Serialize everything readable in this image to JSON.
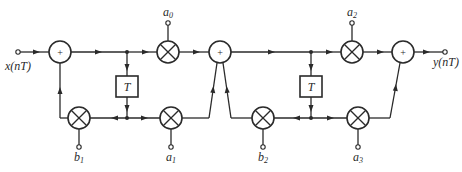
{
  "diagram": {
    "type": "signal-flow block diagram",
    "input_label": "x(nT)",
    "output_label": "y(nT)",
    "adder_symbol": "+",
    "delay_label": "T",
    "coefficients": {
      "a0": {
        "base": "a",
        "sub": "0"
      },
      "a1": {
        "base": "a",
        "sub": "1"
      },
      "a2": {
        "base": "a",
        "sub": "2"
      },
      "a3": {
        "base": "a",
        "sub": "3"
      },
      "b1": {
        "base": "b",
        "sub": "1"
      },
      "b2": {
        "base": "b",
        "sub": "2"
      }
    },
    "blocks": [
      {
        "id": "adder-1",
        "kind": "adder"
      },
      {
        "id": "delay-1",
        "kind": "delay"
      },
      {
        "id": "mult-a0",
        "kind": "multiplier"
      },
      {
        "id": "mult-b1",
        "kind": "multiplier"
      },
      {
        "id": "mult-a1",
        "kind": "multiplier"
      },
      {
        "id": "adder-2",
        "kind": "adder"
      },
      {
        "id": "delay-2",
        "kind": "delay"
      },
      {
        "id": "mult-a2",
        "kind": "multiplier"
      },
      {
        "id": "mult-b2",
        "kind": "multiplier"
      },
      {
        "id": "mult-a3",
        "kind": "multiplier"
      },
      {
        "id": "adder-3",
        "kind": "adder"
      }
    ],
    "colors": {
      "stroke": "#2a2a2a",
      "background": "#ffffff"
    }
  }
}
